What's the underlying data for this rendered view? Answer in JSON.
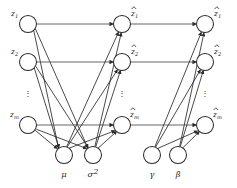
{
  "diagram": {
    "type": "neural-network-graph",
    "colors": {
      "node_stroke": "#2b2b2b",
      "node_fill": "#ffffff",
      "edge": "#2b2b2b",
      "skip_edge": "#555555",
      "text": "#1a1a1a",
      "background": "#ffffff"
    },
    "geometry": {
      "width": 237,
      "height": 188,
      "node_radius": 8.5,
      "param_radius": 8.5,
      "column_x": [
        28,
        122,
        205
      ],
      "row_y": [
        24,
        62,
        125
      ],
      "dots_y": 93,
      "param_y": 155,
      "param_x": [
        64,
        93,
        152,
        178
      ]
    },
    "columns": [
      {
        "name": "input-column",
        "id": "z",
        "nodes": [
          {
            "label_base": "z",
            "label_sub": "1",
            "hat": false,
            "row": 0
          },
          {
            "label_base": "z",
            "label_sub": "2",
            "hat": false,
            "row": 1
          },
          {
            "label_base": "z",
            "label_sub": "m",
            "hat": false,
            "row": 2
          }
        ],
        "ellipsis": "⋮"
      },
      {
        "name": "normalized-column",
        "id": "z-hat",
        "nodes": [
          {
            "label_base": "z",
            "label_sub": "1",
            "hat": true,
            "row": 0
          },
          {
            "label_base": "z",
            "label_sub": "2",
            "hat": true,
            "row": 1
          },
          {
            "label_base": "z",
            "label_sub": "m",
            "hat": true,
            "row": 2
          }
        ],
        "ellipsis": "⋮"
      },
      {
        "name": "scaled-shifted-column",
        "id": "z-tilde",
        "nodes": [
          {
            "label_base": "z",
            "label_sub": "1",
            "hat": true,
            "row": 0
          },
          {
            "label_base": "z",
            "label_sub": "2",
            "hat": true,
            "row": 1
          },
          {
            "label_base": "z",
            "label_sub": "m",
            "hat": true,
            "row": 2
          }
        ],
        "ellipsis": "⋮"
      }
    ],
    "parameters": [
      {
        "name": "mean-node",
        "label": "μ",
        "x": 64
      },
      {
        "name": "variance-node",
        "label": "σ",
        "sup": "2",
        "x": 93
      },
      {
        "name": "gamma-node",
        "label": "γ",
        "x": 152
      },
      {
        "name": "beta-node",
        "label": "β",
        "x": 178
      }
    ],
    "edge_groups": [
      {
        "name": "inputs-to-mean",
        "from": "z",
        "to": "mu"
      },
      {
        "name": "inputs-to-variance",
        "from": "z",
        "to": "sigma2"
      },
      {
        "name": "inputs-to-normalized-skip",
        "from": "z",
        "to": "z-hat"
      },
      {
        "name": "mean-to-normalized",
        "from": "mu",
        "to": "z-hat"
      },
      {
        "name": "variance-to-normalized",
        "from": "sigma2",
        "to": "z-hat"
      },
      {
        "name": "normalized-to-output-skip",
        "from": "z-hat",
        "to": "z-tilde"
      },
      {
        "name": "gamma-to-output",
        "from": "gamma",
        "to": "z-tilde"
      },
      {
        "name": "beta-to-output",
        "from": "beta",
        "to": "z-tilde"
      }
    ]
  }
}
